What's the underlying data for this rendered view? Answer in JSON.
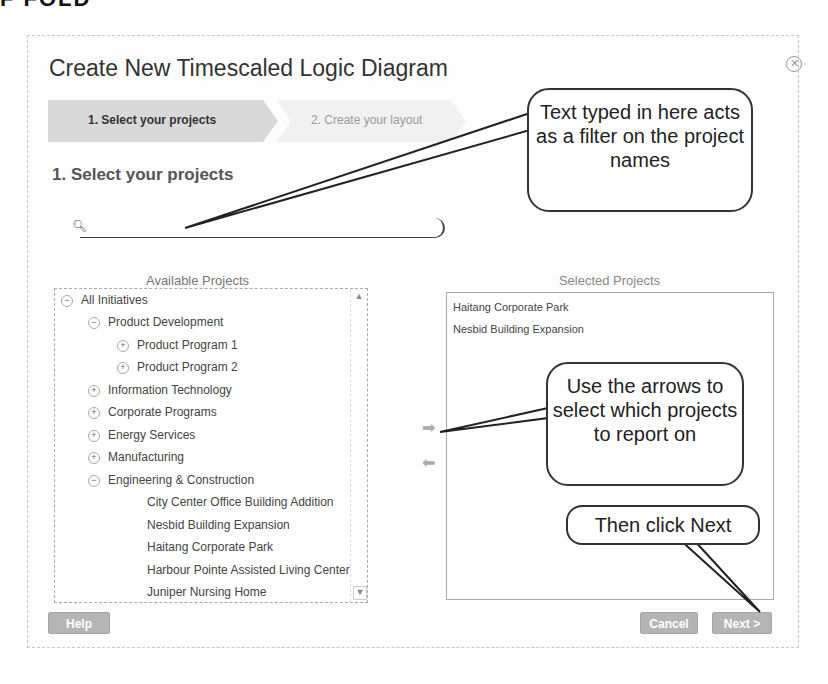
{
  "header_fragment": "F FOLD",
  "dialog": {
    "title": "Create New Timescaled Logic Diagram",
    "close_icon": "close-circle-icon",
    "steps": [
      {
        "label": "1. Select your projects",
        "active": true
      },
      {
        "label": "2. Create your layout",
        "active": false
      }
    ],
    "section_title": "1. Select your projects",
    "search": {
      "placeholder": "",
      "value": "",
      "icon": "search-icon"
    },
    "available": {
      "label": "Available Projects",
      "tree": [
        {
          "label": "All Initiatives",
          "level": 0,
          "toggle": "−"
        },
        {
          "label": "Product Development",
          "level": 1,
          "toggle": "−"
        },
        {
          "label": "Product Program 1",
          "level": 2,
          "toggle": "+"
        },
        {
          "label": "Product Program 2",
          "level": 2,
          "toggle": "+"
        },
        {
          "label": "Information Technology",
          "level": 1,
          "toggle": "+"
        },
        {
          "label": "Corporate Programs",
          "level": 1,
          "toggle": "+"
        },
        {
          "label": "Energy Services",
          "level": 1,
          "toggle": "+"
        },
        {
          "label": "Manufacturing",
          "level": 1,
          "toggle": "+"
        },
        {
          "label": "Engineering & Construction",
          "level": 1,
          "toggle": "−"
        },
        {
          "label": "City Center Office Building Addition",
          "level": 3,
          "toggle": ""
        },
        {
          "label": "Nesbid Building Expansion",
          "level": 3,
          "toggle": ""
        },
        {
          "label": "Haitang Corporate Park",
          "level": 3,
          "toggle": ""
        },
        {
          "label": "Harbour Pointe Assisted Living Center",
          "level": 3,
          "toggle": ""
        },
        {
          "label": "Juniper Nursing Home",
          "level": 3,
          "toggle": ""
        }
      ]
    },
    "selected": {
      "label": "Selected Projects",
      "items": [
        "Haitang Corporate Park",
        "Nesbid Building Expansion"
      ]
    },
    "arrows": {
      "add": "➡",
      "remove": "⬅"
    },
    "buttons": {
      "help": "Help",
      "cancel": "Cancel",
      "next": "Next >"
    }
  },
  "callouts": {
    "filter": "Text typed in here acts as a filter on the project names",
    "arrows": "Use the arrows to select which projects to report on",
    "next": "Then click Next"
  },
  "colors": {
    "button_gray": "#b5b5b5",
    "active_step": "#d9d9d9",
    "inactive_step": "#f1f1f1"
  }
}
